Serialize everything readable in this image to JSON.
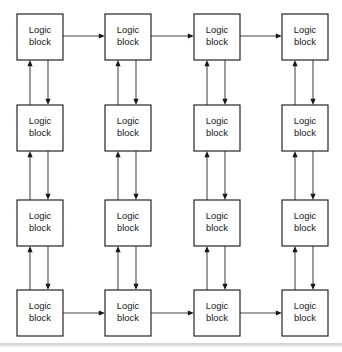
{
  "figure": {
    "kind": "block-diagram",
    "title": "",
    "background_color": "#ffffff",
    "grid": {
      "rows": 4,
      "columns": 4
    },
    "block": {
      "label_line_1": "Logic",
      "label_line_2": "block",
      "width": 46,
      "height": 46,
      "fill_color": "#ffffff",
      "border_color": "#1c1c1c"
    },
    "blocks": [
      {
        "id": "block-r1c1",
        "row": 1,
        "col": 1,
        "x": 17,
        "y": 14,
        "label_line_1": "Logic",
        "label_line_2": "block"
      },
      {
        "id": "block-r1c2",
        "row": 1,
        "col": 2,
        "x": 105,
        "y": 14,
        "label_line_1": "Logic",
        "label_line_2": "block"
      },
      {
        "id": "block-r1c3",
        "row": 1,
        "col": 3,
        "x": 194,
        "y": 14,
        "label_line_1": "Logic",
        "label_line_2": "block"
      },
      {
        "id": "block-r1c4",
        "row": 1,
        "col": 4,
        "x": 282,
        "y": 14,
        "label_line_1": "Logic",
        "label_line_2": "block"
      },
      {
        "id": "block-r2c1",
        "row": 2,
        "col": 1,
        "x": 17,
        "y": 105,
        "label_line_1": "Logic",
        "label_line_2": "block"
      },
      {
        "id": "block-r2c2",
        "row": 2,
        "col": 2,
        "x": 105,
        "y": 105,
        "label_line_1": "Logic",
        "label_line_2": "block"
      },
      {
        "id": "block-r2c3",
        "row": 2,
        "col": 3,
        "x": 194,
        "y": 105,
        "label_line_1": "Logic",
        "label_line_2": "block"
      },
      {
        "id": "block-r2c4",
        "row": 2,
        "col": 4,
        "x": 282,
        "y": 105,
        "label_line_1": "Logic",
        "label_line_2": "block"
      },
      {
        "id": "block-r3c1",
        "row": 3,
        "col": 1,
        "x": 17,
        "y": 200,
        "label_line_1": "Logic",
        "label_line_2": "block"
      },
      {
        "id": "block-r3c2",
        "row": 3,
        "col": 2,
        "x": 105,
        "y": 200,
        "label_line_1": "Logic",
        "label_line_2": "block"
      },
      {
        "id": "block-r3c3",
        "row": 3,
        "col": 3,
        "x": 194,
        "y": 200,
        "label_line_1": "Logic",
        "label_line_2": "block"
      },
      {
        "id": "block-r3c4",
        "row": 3,
        "col": 4,
        "x": 282,
        "y": 200,
        "label_line_1": "Logic",
        "label_line_2": "block"
      },
      {
        "id": "block-r4c1",
        "row": 4,
        "col": 1,
        "x": 17,
        "y": 290,
        "label_line_1": "Logic",
        "label_line_2": "block"
      },
      {
        "id": "block-r4c2",
        "row": 4,
        "col": 2,
        "x": 105,
        "y": 290,
        "label_line_1": "Logic",
        "label_line_2": "block"
      },
      {
        "id": "block-r4c3",
        "row": 4,
        "col": 3,
        "x": 194,
        "y": 290,
        "label_line_1": "Logic",
        "label_line_2": "block"
      },
      {
        "id": "block-r4c4",
        "row": 4,
        "col": 4,
        "x": 282,
        "y": 290,
        "label_line_1": "Logic",
        "label_line_2": "block"
      }
    ],
    "connections": {
      "line_color": "#43464a",
      "arrowhead_color": "#15181c",
      "horizontal": [
        {
          "id": "arrow-r1c1-to-r1c2",
          "from": "block-r1c1",
          "to": "block-r1c2",
          "direction": "right",
          "y": 36
        },
        {
          "id": "arrow-r1c2-to-r1c3",
          "from": "block-r1c2",
          "to": "block-r1c3",
          "direction": "right",
          "y": 36
        },
        {
          "id": "arrow-r1c3-to-r1c4",
          "from": "block-r1c3",
          "to": "block-r1c4",
          "direction": "right",
          "y": 36
        },
        {
          "id": "arrow-r4c1-to-r4c2",
          "from": "block-r4c1",
          "to": "block-r4c2",
          "direction": "right",
          "y": 313
        },
        {
          "id": "arrow-r4c2-to-r4c3",
          "from": "block-r4c2",
          "to": "block-r4c3",
          "direction": "right",
          "y": 313
        },
        {
          "id": "arrow-r4c3-to-r4c4",
          "from": "block-r4c3",
          "to": "block-r4c4",
          "direction": "right",
          "y": 313
        }
      ],
      "vertical_pair_offsets": {
        "up_arrow_dx": 13,
        "down_arrow_dx": 31
      },
      "vertical": [
        {
          "id": "arrow-up-c1-r2-to-r1",
          "column": 1,
          "direction": "up",
          "from": "block-r2c1",
          "to": "block-r1c1"
        },
        {
          "id": "arrow-down-c1-r1-to-r2",
          "column": 1,
          "direction": "down",
          "from": "block-r1c1",
          "to": "block-r2c1"
        },
        {
          "id": "arrow-up-c1-r3-to-r2",
          "column": 1,
          "direction": "up",
          "from": "block-r3c1",
          "to": "block-r2c1"
        },
        {
          "id": "arrow-down-c1-r2-to-r3",
          "column": 1,
          "direction": "down",
          "from": "block-r2c1",
          "to": "block-r3c1"
        },
        {
          "id": "arrow-up-c1-r4-to-r3",
          "column": 1,
          "direction": "up",
          "from": "block-r4c1",
          "to": "block-r3c1"
        },
        {
          "id": "arrow-down-c1-r3-to-r4",
          "column": 1,
          "direction": "down",
          "from": "block-r3c1",
          "to": "block-r4c1"
        },
        {
          "id": "arrow-up-c2-r2-to-r1",
          "column": 2,
          "direction": "up",
          "from": "block-r2c2",
          "to": "block-r1c2"
        },
        {
          "id": "arrow-down-c2-r1-to-r2",
          "column": 2,
          "direction": "down",
          "from": "block-r1c2",
          "to": "block-r2c2"
        },
        {
          "id": "arrow-up-c2-r3-to-r2",
          "column": 2,
          "direction": "up",
          "from": "block-r3c2",
          "to": "block-r2c2"
        },
        {
          "id": "arrow-down-c2-r2-to-r3",
          "column": 2,
          "direction": "down",
          "from": "block-r2c2",
          "to": "block-r3c2"
        },
        {
          "id": "arrow-up-c2-r4-to-r3",
          "column": 2,
          "direction": "up",
          "from": "block-r4c2",
          "to": "block-r3c2"
        },
        {
          "id": "arrow-down-c2-r3-to-r4",
          "column": 2,
          "direction": "down",
          "from": "block-r3c2",
          "to": "block-r4c2"
        },
        {
          "id": "arrow-up-c3-r2-to-r1",
          "column": 3,
          "direction": "up",
          "from": "block-r2c3",
          "to": "block-r1c3"
        },
        {
          "id": "arrow-down-c3-r1-to-r2",
          "column": 3,
          "direction": "down",
          "from": "block-r1c3",
          "to": "block-r2c3"
        },
        {
          "id": "arrow-up-c3-r3-to-r2",
          "column": 3,
          "direction": "up",
          "from": "block-r3c3",
          "to": "block-r2c3"
        },
        {
          "id": "arrow-down-c3-r2-to-r3",
          "column": 3,
          "direction": "down",
          "from": "block-r2c3",
          "to": "block-r3c3"
        },
        {
          "id": "arrow-up-c3-r4-to-r3",
          "column": 3,
          "direction": "up",
          "from": "block-r4c3",
          "to": "block-r3c3"
        },
        {
          "id": "arrow-down-c3-r3-to-r4",
          "column": 3,
          "direction": "down",
          "from": "block-r3c3",
          "to": "block-r4c3"
        },
        {
          "id": "arrow-up-c4-r2-to-r1",
          "column": 4,
          "direction": "up",
          "from": "block-r2c4",
          "to": "block-r1c4"
        },
        {
          "id": "arrow-down-c4-r1-to-r2",
          "column": 4,
          "direction": "down",
          "from": "block-r1c4",
          "to": "block-r2c4"
        },
        {
          "id": "arrow-up-c4-r3-to-r2",
          "column": 4,
          "direction": "up",
          "from": "block-r3c4",
          "to": "block-r2c4"
        },
        {
          "id": "arrow-down-c4-r2-to-r3",
          "column": 4,
          "direction": "down",
          "from": "block-r2c4",
          "to": "block-r3c4"
        },
        {
          "id": "arrow-up-c4-r4-to-r3",
          "column": 4,
          "direction": "up",
          "from": "block-r4c4",
          "to": "block-r3c4"
        },
        {
          "id": "arrow-down-c4-r3-to-r4",
          "column": 4,
          "direction": "down",
          "from": "block-r3c4",
          "to": "block-r4c4"
        }
      ]
    },
    "footer_rule": {
      "y": 344,
      "x1": 0,
      "x2": 342,
      "color": "#a9acb0"
    }
  }
}
